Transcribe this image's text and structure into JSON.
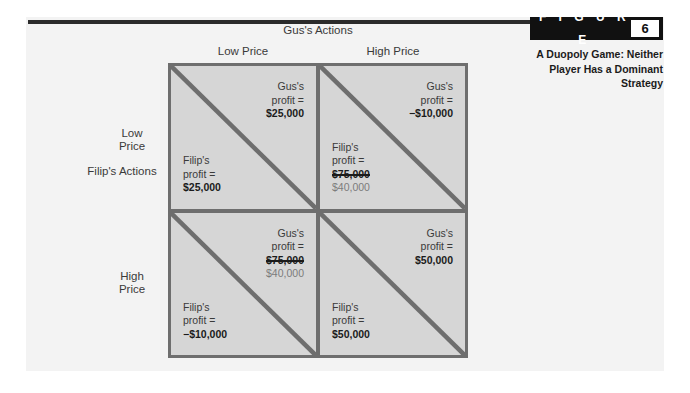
{
  "figure": {
    "badge_word": "F I G U R E",
    "number": "6",
    "caption": "A Duopoly Game: Neither Player Has a Dominant Strategy"
  },
  "matrix": {
    "column_group_title": "Gus's Actions",
    "row_group_title": "Filip's Actions",
    "column_headers": [
      "Low Price",
      "High Price"
    ],
    "row_headers": [
      "Low\nPrice",
      "High\nPrice"
    ],
    "row_header_0_line1": "Low",
    "row_header_0_line2": "Price",
    "row_header_1_line1": "High",
    "row_header_1_line2": "Price",
    "cells": [
      {
        "row": "Low Price",
        "column": "Low Price",
        "upper": {
          "who": "Gus's",
          "label": "profit =",
          "amount": "$25,000",
          "struck": false,
          "revision": null
        },
        "lower": {
          "who": "Filip's",
          "label": "profit =",
          "amount": "$25,000",
          "struck": false,
          "revision": null
        }
      },
      {
        "row": "Low Price",
        "column": "High Price",
        "upper": {
          "who": "Gus's",
          "label": "profit =",
          "amount": "−$10,000",
          "struck": false,
          "revision": null
        },
        "lower": {
          "who": "Filip's",
          "label": "profit =",
          "amount": "$75,000",
          "struck": true,
          "revision": "$40,000"
        }
      },
      {
        "row": "High Price",
        "column": "Low Price",
        "upper": {
          "who": "Gus's",
          "label": "profit =",
          "amount": "$75,000",
          "struck": true,
          "revision": "$40,000"
        },
        "lower": {
          "who": "Filip's",
          "label": "profit =",
          "amount": "−$10,000",
          "struck": false,
          "revision": null
        }
      },
      {
        "row": "High Price",
        "column": "High Price",
        "upper": {
          "who": "Gus's",
          "label": "profit =",
          "amount": "$50,000",
          "struck": false,
          "revision": null
        },
        "lower": {
          "who": "Filip's",
          "label": "profit =",
          "amount": "$50,000",
          "struck": false,
          "revision": null
        }
      }
    ]
  },
  "colors": {
    "badge_background": "#111111",
    "cell_background": "#d6d6d6",
    "rule": "#2b2b2b",
    "grid_line": "#6e6e6e",
    "page_background": "#f3f3f3",
    "revision_text": "#7c7c7c"
  }
}
